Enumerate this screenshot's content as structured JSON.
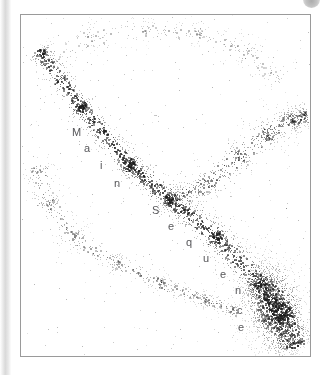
{
  "figure": {
    "kind": "scatter",
    "frame": {
      "x": 20,
      "y": 14,
      "width": 291,
      "height": 343,
      "border_color": "#9a9a9a"
    },
    "background_color": "#ffffff",
    "point_color": "#1a1a1a",
    "label_color": "#57575a",
    "page_edge_shadow_color": "#d9d9d9",
    "corner_artifact": "circle-artifact"
  },
  "labels": {
    "main_sequence_text": "Main Sequence",
    "letters": [
      {
        "char": "M",
        "x": 71,
        "y": 126
      },
      {
        "char": "a",
        "x": 83,
        "y": 142
      },
      {
        "char": "i",
        "x": 99,
        "y": 159
      },
      {
        "char": "n",
        "x": 113,
        "y": 177
      },
      {
        "char": "S",
        "x": 151,
        "y": 204
      },
      {
        "char": "e",
        "x": 167,
        "y": 220
      },
      {
        "char": "q",
        "x": 185,
        "y": 236
      },
      {
        "char": "u",
        "x": 202,
        "y": 252
      },
      {
        "char": "e",
        "x": 219,
        "y": 268
      },
      {
        "char": "n",
        "x": 234,
        "y": 284
      },
      {
        "char": "c",
        "x": 236,
        "y": 304
      },
      {
        "char": "e",
        "x": 237,
        "y": 321
      }
    ]
  },
  "chart_data": {
    "type": "scatter",
    "title": "",
    "subtitle": "",
    "xlabel": "",
    "ylabel": "",
    "xlim": [
      0,
      289
    ],
    "ylim": [
      0,
      341
    ],
    "grid": false,
    "legend": null,
    "annotations": [
      {
        "text": "Main Sequence",
        "placement": "along-diagonal-band",
        "orientation": "top-left-to-bottom-right"
      }
    ],
    "note": "Hertzsprung-Russell style scatter: dense diagonal Main Sequence band from upper-left to lower-right, an upward-right giant branch, a sparse lower-left arc, a dense lower-right clump, and sparse field scatter across the top.",
    "series": [
      {
        "name": "main-sequence-band",
        "kind": "band",
        "n_points": 2600,
        "path": [
          [
            18,
            36
          ],
          [
            60,
            92
          ],
          [
            108,
            150
          ],
          [
            150,
            185
          ],
          [
            196,
            222
          ],
          [
            238,
            268
          ],
          [
            262,
            300
          ],
          [
            272,
            330
          ]
        ],
        "width_profile": [
          13,
          14,
          15,
          16,
          17,
          20,
          24,
          26
        ],
        "density": "high"
      },
      {
        "name": "giant-branch",
        "kind": "band",
        "n_points": 780,
        "path": [
          [
            152,
            186
          ],
          [
            186,
            168
          ],
          [
            218,
            140
          ],
          [
            246,
            118
          ],
          [
            270,
            104
          ],
          [
            285,
            100
          ]
        ],
        "width_profile": [
          16,
          18,
          19,
          18,
          16,
          14
        ],
        "density": "medium"
      },
      {
        "name": "lower-left-arc",
        "kind": "band",
        "n_points": 720,
        "path": [
          [
            16,
            150
          ],
          [
            26,
            188
          ],
          [
            52,
            222
          ],
          [
            96,
            248
          ],
          [
            140,
            268
          ],
          [
            184,
            284
          ],
          [
            214,
            296
          ]
        ],
        "width_profile": [
          20,
          19,
          16,
          13,
          11,
          10,
          9
        ],
        "density": "low"
      },
      {
        "name": "lower-right-clump",
        "kind": "blob",
        "n_points": 1500,
        "center": [
          252,
          292
        ],
        "radii": [
          30,
          52
        ],
        "rotation_deg": -18,
        "density": "very-high"
      },
      {
        "name": "upper-field-scatter",
        "kind": "sparse-arc",
        "n_points": 420,
        "path": [
          [
            24,
            46
          ],
          [
            70,
            22
          ],
          [
            124,
            14
          ],
          [
            178,
            18
          ],
          [
            226,
            36
          ],
          [
            258,
            64
          ]
        ],
        "width_profile": [
          22,
          20,
          17,
          16,
          18,
          22
        ],
        "density": "very-low"
      },
      {
        "name": "diffuse-halo",
        "kind": "diffuse",
        "n_points": 340,
        "density": "very-low"
      }
    ]
  }
}
